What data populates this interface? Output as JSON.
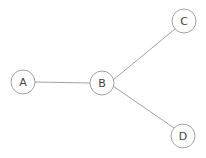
{
  "graph": {
    "nodes": [
      {
        "id": "A",
        "label": "A",
        "x": 23,
        "y": 82
      },
      {
        "id": "B",
        "label": "B",
        "x": 102,
        "y": 83
      },
      {
        "id": "C",
        "label": "C",
        "x": 184,
        "y": 21
      },
      {
        "id": "D",
        "label": "D",
        "x": 183,
        "y": 136
      }
    ],
    "edges": [
      {
        "from": "A",
        "to": "B"
      },
      {
        "from": "B",
        "to": "C"
      },
      {
        "from": "B",
        "to": "D"
      }
    ],
    "node_radius": 12,
    "colors": {
      "stroke": "#8a8a8a",
      "edge": "#8a8a8a",
      "text": "#444444",
      "fill": "#ffffff"
    }
  }
}
